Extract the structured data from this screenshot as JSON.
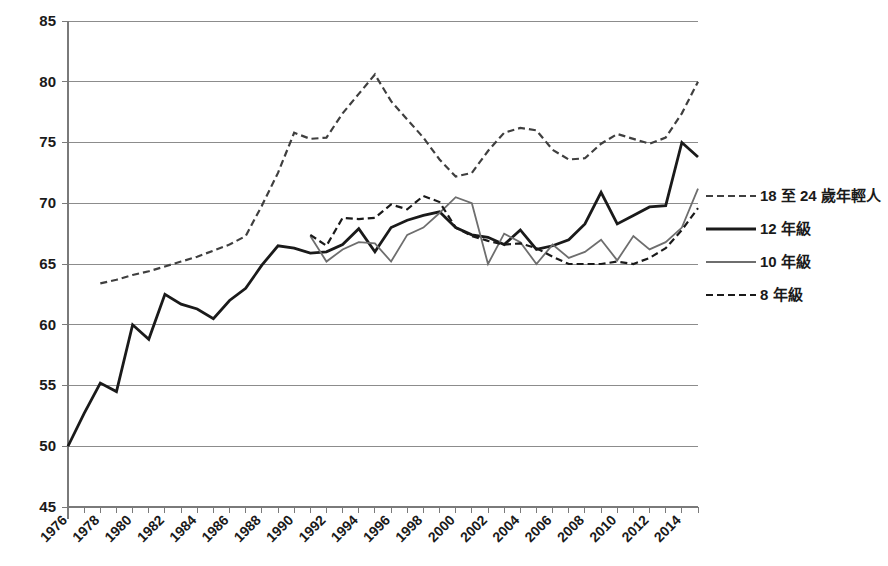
{
  "chart_data": {
    "type": "line",
    "title": "",
    "subtitle": "",
    "xlabel": "",
    "ylabel": "",
    "xlim": [
      1976,
      2015
    ],
    "ylim": [
      45,
      85
    ],
    "yticks": [
      45,
      50,
      55,
      60,
      65,
      70,
      75,
      80,
      85
    ],
    "xticks": [
      1976,
      1978,
      1980,
      1982,
      1984,
      1986,
      1988,
      1990,
      1992,
      1994,
      1996,
      1998,
      2000,
      2002,
      2004,
      2006,
      2008,
      2010,
      2012,
      2014
    ],
    "xtick_labels": [
      "1976",
      "1978",
      "1980",
      "1982",
      "1984",
      "1986",
      "1988",
      "1990",
      "1992",
      "1994",
      "1996",
      "1998",
      "2000",
      "2002",
      "2004",
      "2006",
      "2008",
      "2010",
      "2012",
      "2014"
    ],
    "ytick_labels": [
      "45",
      "50",
      "55",
      "60",
      "65",
      "70",
      "75",
      "80",
      "85"
    ],
    "grid": true,
    "grid_axis": "y",
    "legend_position": "right",
    "series": [
      {
        "name": "18 至 24 歲年輕人",
        "style": "dashed",
        "color": "#3f3f3f",
        "width": 2.2,
        "dash": "7,4",
        "x": [
          1978,
          1979,
          1980,
          1981,
          1982,
          1983,
          1984,
          1985,
          1986,
          1987,
          1988,
          1989,
          1990,
          1991,
          1992,
          1993,
          1994,
          1995,
          1996,
          1997,
          1998,
          1999,
          2000,
          2001,
          2002,
          2003,
          2004,
          2005,
          2006,
          2007,
          2008,
          2009,
          2010,
          2011,
          2012,
          2013,
          2014,
          2015
        ],
        "y": [
          63.4,
          63.7,
          64.1,
          64.4,
          64.8,
          65.2,
          65.6,
          66.1,
          66.6,
          67.3,
          69.8,
          72.5,
          75.8,
          75.3,
          75.4,
          77.4,
          79.0,
          80.6,
          78.4,
          76.9,
          75.4,
          73.6,
          72.2,
          72.5,
          74.3,
          75.8,
          76.2,
          76.0,
          74.4,
          73.6,
          73.7,
          74.9,
          75.7,
          75.3,
          74.9,
          75.4,
          77.4,
          80.0
        ]
      },
      {
        "name": "12 年級",
        "style": "solid",
        "color": "#1a1a1a",
        "width": 2.8,
        "dash": "",
        "x": [
          1976,
          1977,
          1978,
          1979,
          1980,
          1981,
          1982,
          1983,
          1984,
          1985,
          1986,
          1987,
          1988,
          1989,
          1990,
          1991,
          1992,
          1993,
          1994,
          1995,
          1996,
          1997,
          1998,
          1999,
          2000,
          2001,
          2002,
          2003,
          2004,
          2005,
          2006,
          2007,
          2008,
          2009,
          2010,
          2011,
          2012,
          2013,
          2014,
          2015
        ],
        "y": [
          50.0,
          52.7,
          55.2,
          54.5,
          60.0,
          58.8,
          62.5,
          61.7,
          61.3,
          60.5,
          62.0,
          63.0,
          64.9,
          66.5,
          66.3,
          65.9,
          66.0,
          66.6,
          67.9,
          66.0,
          68.0,
          68.6,
          69.0,
          69.3,
          68.0,
          67.4,
          67.2,
          66.6,
          67.8,
          66.2,
          66.5,
          67.0,
          68.3,
          70.9,
          68.3,
          69.0,
          69.7,
          69.8,
          75.0,
          73.8
        ]
      },
      {
        "name": "10 年級",
        "style": "solid",
        "color": "#6e6e6e",
        "width": 1.8,
        "dash": "",
        "x": [
          1991,
          1992,
          1993,
          1994,
          1995,
          1996,
          1997,
          1998,
          1999,
          2000,
          2001,
          2002,
          2003,
          2004,
          2005,
          2006,
          2007,
          2008,
          2009,
          2010,
          2011,
          2012,
          2013,
          2014,
          2015
        ],
        "y": [
          67.3,
          65.2,
          66.2,
          66.8,
          66.7,
          65.2,
          67.4,
          68.0,
          69.2,
          70.5,
          70.0,
          65.0,
          67.5,
          66.8,
          65.0,
          66.6,
          65.5,
          66.0,
          67.0,
          65.3,
          67.3,
          66.2,
          66.8,
          68.0,
          71.2
        ]
      },
      {
        "name": "8 年級",
        "style": "dashed",
        "color": "#1a1a1a",
        "width": 2.2,
        "dash": "7,4",
        "x": [
          1991,
          1992,
          1993,
          1994,
          1995,
          1996,
          1997,
          1998,
          1999,
          2000,
          2001,
          2002,
          2003,
          2004,
          2005,
          2006,
          2007,
          2008,
          2009,
          2010,
          2011,
          2012,
          2013,
          2014,
          2015
        ],
        "y": [
          67.4,
          66.5,
          68.8,
          68.7,
          68.8,
          69.9,
          69.5,
          70.6,
          70.1,
          68.0,
          67.3,
          66.9,
          66.6,
          66.7,
          66.3,
          65.6,
          65.0,
          65.0,
          65.0,
          65.2,
          65.0,
          65.5,
          66.3,
          67.8,
          69.6
        ]
      }
    ]
  },
  "legend": {
    "items": [
      {
        "label": "18 至 24 歲年輕人",
        "style": "dashed",
        "color": "#3f3f3f",
        "width": 2.2
      },
      {
        "label": "12 年級",
        "style": "solid",
        "color": "#1a1a1a",
        "width": 2.8
      },
      {
        "label": "10 年級",
        "style": "solid",
        "color": "#6e6e6e",
        "width": 1.8
      },
      {
        "label": "8 年級",
        "style": "dashed",
        "color": "#1a1a1a",
        "width": 2.2
      }
    ]
  },
  "axes": {
    "plot_left": 68,
    "plot_right": 698,
    "plot_top": 21,
    "plot_bottom": 507
  }
}
